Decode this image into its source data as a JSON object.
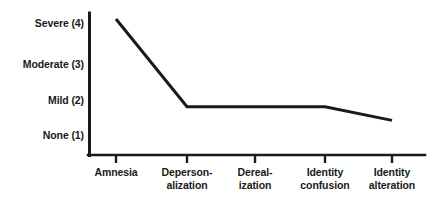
{
  "chart_data": {
    "type": "line",
    "title": "",
    "subtitle": "",
    "xlabel": "",
    "ylabel": "",
    "grid": false,
    "legend": "none",
    "categories": [
      "Amnesia",
      "Depersonalization",
      "Derealization",
      "Identity confusion",
      "Identity alteration"
    ],
    "category_lines": [
      [
        "Amnesia"
      ],
      [
        "Deperson-",
        "alization"
      ],
      [
        "Dereal-",
        "ization"
      ],
      [
        "Identity",
        "confusion"
      ],
      [
        "Identity",
        "alteration"
      ]
    ],
    "values": [
      4.0,
      1.75,
      1.75,
      1.75,
      1.4
    ],
    "ylim": [
      1,
      4
    ],
    "ytick_values": [
      4,
      3,
      2,
      1
    ],
    "ytick_labels": [
      "Severe (4)",
      "Moderate (3)",
      "Mild (2)",
      "None (1)"
    ],
    "series": [
      {
        "name": "Dissociative symptom severity",
        "values": [
          4.0,
          1.75,
          1.75,
          1.75,
          1.4
        ]
      }
    ],
    "line_color": "#1a1a1a",
    "axis_color": "#1a1a1a",
    "background_color": "#ffffff",
    "markers": "none"
  },
  "axes": {
    "y_axis_name": "severity-axis",
    "x_axis_name": "symptom-axis"
  }
}
